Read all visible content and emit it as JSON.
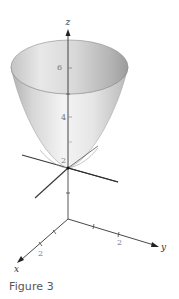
{
  "figure": {
    "caption": "Figure 3",
    "surface": "elliptic paraboloid opening upward along z-axis",
    "axes": {
      "z": {
        "label": "z",
        "ticks": [
          "2",
          "4",
          "6"
        ]
      },
      "x": {
        "label": "x",
        "ticks": [
          "2"
        ]
      },
      "y": {
        "label": "y",
        "ticks": [
          "2"
        ]
      }
    },
    "colors": {
      "surface_light": "#f2f2f2",
      "surface_mid": "#d4d4d4",
      "surface_dark": "#a8a8a8",
      "axis": "#333333"
    }
  }
}
